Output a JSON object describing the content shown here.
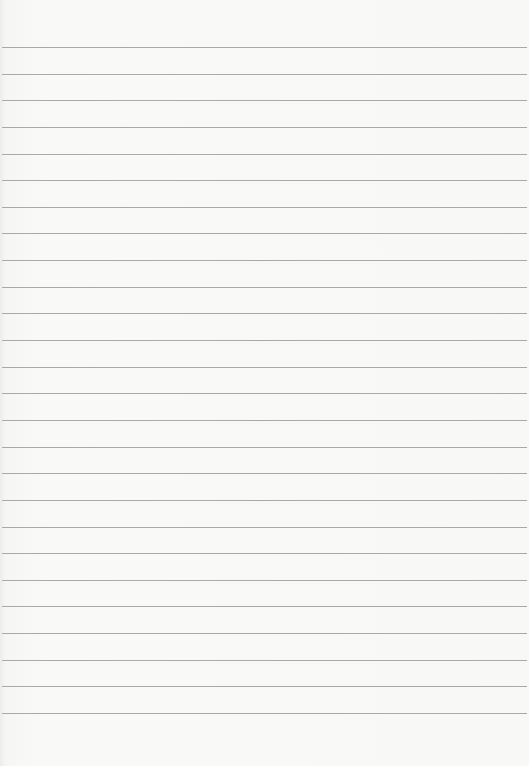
{
  "paper": {
    "description": "Blank ruled sheet of paper",
    "line_count": 26,
    "first_line_y": 47,
    "line_spacing": 26.64,
    "line_color": "#a9a9a9",
    "background_color": "#f8f8f7"
  }
}
